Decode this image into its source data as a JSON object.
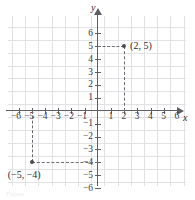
{
  "figure": {
    "type": "cartesian-coordinate-plane",
    "caption": "Figure",
    "axis_labels": {
      "x": "x",
      "y": "y"
    },
    "colors": {
      "grid": "#e2e2e4",
      "axis": "#5e5e63",
      "point": "#4a4a50",
      "dashed_guide": "#6a6a70",
      "text": "#2c2c30",
      "background": "#ffffff"
    }
  },
  "chart_data": {
    "type": "scatter",
    "title": "",
    "xlabel": "x",
    "ylabel": "y",
    "xlim": [
      -7,
      7
    ],
    "ylim": [
      -7,
      7
    ],
    "grid": true,
    "legend": "none",
    "x_ticks": [
      -6,
      -5,
      -4,
      -3,
      -2,
      -1,
      1,
      2,
      3,
      4,
      5,
      6
    ],
    "y_ticks": [
      6,
      5,
      4,
      3,
      2,
      1,
      -1,
      -2,
      -3,
      -4,
      -5,
      -6
    ],
    "x_tick_labels": [
      "−6",
      "−5",
      "−4",
      "−3",
      "−2",
      "−1",
      "1",
      "2",
      "3",
      "4",
      "5",
      "6"
    ],
    "y_tick_labels": [
      "6",
      "5",
      "4",
      "3",
      "2",
      "1",
      "−1",
      "−2",
      "−3",
      "−4",
      "−5",
      "−6"
    ],
    "points": [
      {
        "x": 2,
        "y": 5,
        "label": "(2, 5)",
        "guides": [
          "horizontal-to-y-axis",
          "vertical-to-x-axis"
        ]
      },
      {
        "x": -5,
        "y": -4,
        "label": "(−5, −4)",
        "guides": [
          "horizontal-to-y-axis",
          "vertical-to-x-axis"
        ]
      }
    ]
  }
}
